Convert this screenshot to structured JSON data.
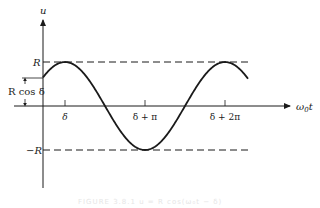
{
  "diagram": {
    "type": "cosine-oscillation-graph",
    "axes": {
      "vertical_label": "u",
      "horizontal_label_main": "ω",
      "horizontal_label_sub": "0",
      "horizontal_label_var": "t"
    },
    "levels": {
      "upper": "R",
      "lower": "−R",
      "initial_value": "R cos δ"
    },
    "ticks": [
      "δ",
      "δ + π",
      "δ + 2π"
    ],
    "caption": "FIGURE 3.8.1  u = R cos(ω₀t − δ)",
    "colors": {
      "ink": "#1a1a1a",
      "caption": "#e6e6e6"
    }
  }
}
